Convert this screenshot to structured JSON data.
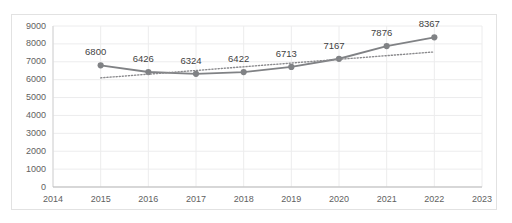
{
  "chart_data": {
    "type": "line",
    "title": "",
    "subtitle": "",
    "xlabel": "",
    "ylabel": "",
    "x": [
      2014,
      2015,
      2016,
      2017,
      2018,
      2019,
      2020,
      2021,
      2022,
      2023
    ],
    "categories": [
      "2014",
      "2015",
      "2016",
      "2017",
      "2018",
      "2019",
      "2020",
      "2021",
      "2022",
      "2023"
    ],
    "xlim": [
      2014,
      2023
    ],
    "ylim": [
      0,
      9000
    ],
    "y_ticks": [
      0,
      1000,
      2000,
      3000,
      4000,
      5000,
      6000,
      7000,
      8000,
      9000
    ],
    "y_tick_labels": [
      "0",
      "1000",
      "2000",
      "3000",
      "4000",
      "5000",
      "6000",
      "7000",
      "8000",
      "9000"
    ],
    "x_tick_labels": [
      "2014",
      "2015",
      "2016",
      "2017",
      "2018",
      "2019",
      "2020",
      "2021",
      "2022",
      "2023"
    ],
    "grid": true,
    "grid_color": "#ececed",
    "legend": false,
    "legend_position": "none",
    "series": [
      {
        "name": "series-1",
        "type": "line",
        "style": "solid",
        "color": "#808285",
        "marker": "circle",
        "marker_color": "#808285",
        "x": [
          2015,
          2016,
          2017,
          2018,
          2019,
          2020,
          2021,
          2022
        ],
        "values": [
          6800,
          6426,
          6324,
          6422,
          6713,
          7167,
          7876,
          8367
        ],
        "data_labels": [
          "6800",
          "6426",
          "6324",
          "6422",
          "6713",
          "7167",
          "7876",
          "8367"
        ]
      },
      {
        "name": "trendline",
        "type": "line",
        "style": "dotted",
        "color": "#8a8a8d",
        "marker": "none",
        "x": [
          2015,
          2022
        ],
        "values": [
          6100,
          7550
        ],
        "data_labels": []
      }
    ]
  }
}
